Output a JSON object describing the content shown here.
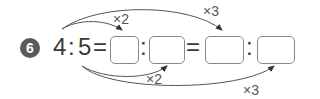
{
  "problem": {
    "number": "6",
    "left_term": "4",
    "right_term": "5",
    "colon": ":",
    "equals": "=",
    "blanks": [
      "",
      "",
      "",
      ""
    ],
    "top_arrows": [
      {
        "label": "×2",
        "from": "4",
        "to": "blank-1"
      },
      {
        "label": "×3",
        "from": "4",
        "to": "blank-3"
      }
    ],
    "bottom_arrows": [
      {
        "label": "×2",
        "from": "5",
        "to": "blank-2"
      },
      {
        "label": "×3",
        "from": "5",
        "to": "blank-4"
      }
    ]
  },
  "colors": {
    "badge": "#5a5a5a",
    "text": "#3a3a3a",
    "box_border": "#8a8a8a",
    "arrow": "#333333"
  }
}
